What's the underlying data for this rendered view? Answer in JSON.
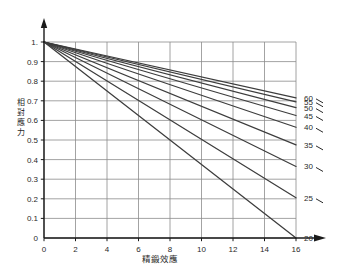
{
  "chart_data": {
    "type": "line",
    "title": "",
    "subtitle": "",
    "xlabel": "精鍛效應",
    "ylabel": "相對應力",
    "xlim": [
      0,
      16
    ],
    "ylim": [
      0,
      1.0
    ],
    "grid": true,
    "legend_position": "right-of-plot-inline-end-labels",
    "x_ticks": [
      "0",
      "2",
      "4",
      "6",
      "8",
      "10",
      "12",
      "14",
      "16"
    ],
    "x_tick_values": [
      0,
      2,
      4,
      6,
      8,
      10,
      12,
      14,
      16
    ],
    "y_ticks": [
      "1.",
      "0.9",
      "0.8",
      "0.7",
      "0.6",
      "0.5",
      "0.4",
      "0.3",
      "0.2",
      "0.1",
      "0"
    ],
    "y_tick_values": [
      1.0,
      0.9,
      0.8,
      0.7,
      0.6,
      0.5,
      0.4,
      0.3,
      0.2,
      0.1,
      0.0
    ],
    "x_minor_step": 2,
    "y_minor_step": 0.1,
    "common_origin": {
      "x": 0,
      "y": 1.0
    },
    "series": [
      {
        "name": "60",
        "label": "60",
        "x": [
          0,
          16
        ],
        "values": [
          1.0,
          0.715
        ]
      },
      {
        "name": "55",
        "label": "55",
        "x": [
          0,
          16
        ],
        "values": [
          1.0,
          0.695
        ]
      },
      {
        "name": "50",
        "label": "50",
        "x": [
          0,
          16
        ],
        "values": [
          1.0,
          0.665
        ]
      },
      {
        "name": "45",
        "label": "45",
        "x": [
          0,
          16
        ],
        "values": [
          1.0,
          0.625
        ]
      },
      {
        "name": "40",
        "label": "40",
        "x": [
          0,
          16
        ],
        "values": [
          1.0,
          0.565
        ]
      },
      {
        "name": "35",
        "label": "35",
        "x": [
          0,
          16
        ],
        "values": [
          1.0,
          0.475
        ]
      },
      {
        "name": "30",
        "label": "30",
        "x": [
          0,
          16
        ],
        "values": [
          1.0,
          0.365
        ]
      },
      {
        "name": "25",
        "label": "25",
        "x": [
          0,
          16
        ],
        "values": [
          1.0,
          0.205
        ]
      },
      {
        "name": "20",
        "label": "20",
        "x": [
          0,
          16
        ],
        "values": [
          1.0,
          0.0
        ]
      }
    ],
    "end_labels": [
      "60",
      "55",
      "50",
      "45",
      "40",
      "35",
      "30",
      "25",
      "20"
    ],
    "colors": {
      "line": "#3d3d3d",
      "grid": "#8c8c8c",
      "axis": "#1a1a1a",
      "text": "#2a2a2a",
      "background": "#ffffff"
    }
  },
  "axis": {
    "y_title_chars": [
      "相",
      "對",
      "應",
      "力"
    ],
    "x_title": "精鍛效應"
  }
}
